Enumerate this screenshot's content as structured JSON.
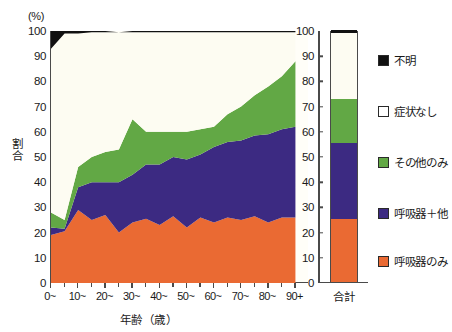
{
  "chart_data": {
    "type": "area",
    "title": "",
    "xlabel": "年齢（歳）",
    "ylabel": "割合",
    "yunit": "(%)",
    "ylim": [
      0,
      100
    ],
    "xlim": [
      0,
      95
    ],
    "grid": false,
    "stacked": true,
    "normalized_to_percent": true,
    "legend_position": "right",
    "x": [
      0,
      5,
      10,
      15,
      20,
      25,
      30,
      35,
      40,
      45,
      50,
      55,
      60,
      65,
      70,
      75,
      80,
      85,
      90
    ],
    "tick_labels": [
      "0~",
      "10~",
      "20~",
      "30~",
      "40~",
      "50~",
      "60~",
      "70~",
      "80~",
      "90+"
    ],
    "tick_values": [
      0,
      10,
      20,
      30,
      40,
      50,
      60,
      70,
      80,
      90
    ],
    "ytick_labels": [
      "0",
      "10",
      "20",
      "30",
      "40",
      "50",
      "60",
      "70",
      "80",
      "90",
      "100"
    ],
    "ytick_values": [
      0,
      10,
      20,
      30,
      40,
      50,
      60,
      70,
      80,
      90,
      100
    ],
    "series": [
      {
        "name": "呼吸器のみ",
        "color": "#ea6a33",
        "order": 1,
        "values": [
          19.0,
          20.5,
          29.0,
          25.0,
          27.0,
          20.0,
          24.0,
          25.5,
          23.0,
          26.5,
          22.0,
          26.0,
          24.0,
          26.0,
          25.0,
          26.5,
          24.0,
          26.0,
          26.0
        ]
      },
      {
        "name": "呼吸器＋他",
        "color": "#3c2a82",
        "order": 2,
        "values": [
          3.0,
          1.0,
          9.0,
          15.0,
          13.0,
          20.0,
          19.0,
          21.5,
          24.0,
          23.5,
          27.0,
          25.0,
          30.0,
          30.0,
          31.5,
          32.0,
          35.0,
          35.0,
          36.0
        ]
      },
      {
        "name": "その他のみ",
        "color": "#62a845",
        "order": 3,
        "values": [
          6.0,
          3.5,
          8.0,
          10.0,
          12.0,
          13.0,
          22.0,
          13.0,
          13.0,
          10.0,
          11.0,
          10.0,
          8.0,
          11.0,
          13.5,
          16.0,
          19.0,
          21.0,
          26.0
        ]
      },
      {
        "name": "症状なし",
        "color": "#fdfcf2",
        "order": 4,
        "values": [
          65.0,
          74.0,
          53.0,
          49.5,
          47.5,
          46.5,
          34.5,
          39.5,
          39.5,
          39.5,
          39.5,
          38.5,
          37.5,
          32.5,
          29.5,
          25.0,
          21.5,
          17.5,
          11.5
        ]
      },
      {
        "name": "不明",
        "color": "#111111",
        "order": 5,
        "values": [
          7.0,
          1.0,
          1.0,
          0.5,
          0.5,
          0.0,
          0.5,
          0.5,
          0.5,
          0.5,
          0.5,
          0.5,
          0.5,
          0.5,
          0.5,
          0.5,
          0.5,
          0.5,
          0.5
        ]
      }
    ],
    "total_bar": {
      "label": "合計",
      "segments": [
        {
          "name": "呼吸器のみ",
          "value": 25.0,
          "color": "#ea6a33"
        },
        {
          "name": "呼吸器＋他",
          "value": 30.0,
          "color": "#3c2a82"
        },
        {
          "name": "その他のみ",
          "value": 17.5,
          "color": "#62a845"
        },
        {
          "name": "症状なし",
          "value": 26.5,
          "color": "#fdfcf2"
        },
        {
          "name": "不明",
          "value": 1.0,
          "color": "#111111"
        }
      ]
    },
    "legend": [
      {
        "label": "不明",
        "color": "#111111"
      },
      {
        "label": "症状なし",
        "color": "#ffffff"
      },
      {
        "label": "その他のみ",
        "color": "#62a845"
      },
      {
        "label": "呼吸器＋他",
        "color": "#3c2a82"
      },
      {
        "label": "呼吸器のみ",
        "color": "#ea6a33"
      }
    ]
  }
}
